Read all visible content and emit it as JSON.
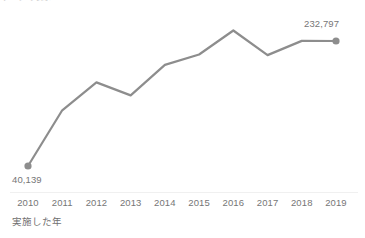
{
  "chart_data": {
    "type": "line",
    "title": "",
    "xlabel": "実施した年",
    "ylabel": "",
    "categories": [
      "2010",
      "2011",
      "2012",
      "2013",
      "2014",
      "2015",
      "2016",
      "2017",
      "2018",
      "2019"
    ],
    "values": [
      40139,
      126000,
      169000,
      149000,
      196000,
      212000,
      249000,
      211000,
      233000,
      232797
    ],
    "point_labels": {
      "first": "40,139",
      "last": "232,797"
    },
    "ylim": [
      0,
      260000
    ],
    "grid": false,
    "legend": false,
    "legend_position": "none",
    "series": [
      {
        "name": "実施した年",
        "values": [
          40139,
          126000,
          169000,
          149000,
          196000,
          212000,
          249000,
          211000,
          233000,
          232797
        ]
      }
    ],
    "annotations": [
      {
        "category": "2010",
        "text": "40,139",
        "position": "below"
      },
      {
        "category": "2019",
        "text": "232,797",
        "position": "above"
      }
    ]
  },
  "colors": {
    "line": "#8d8d8d",
    "marker": "#8d8d8d",
    "axis": "#f0f0f0",
    "label_text": "#767676",
    "clipped_text": "#cccccc"
  },
  "clipped_header": {
    "text": "データの表示"
  },
  "axis": {
    "x_title": "実施した年",
    "ticks": [
      "2010",
      "2011",
      "2012",
      "2013",
      "2014",
      "2015",
      "2016",
      "2017",
      "2018",
      "2019"
    ]
  }
}
